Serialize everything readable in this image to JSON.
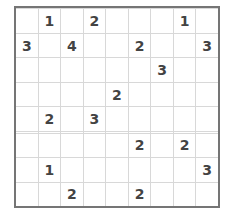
{
  "puzzle": {
    "type": "sudoku-like-number-grid",
    "columns": 9,
    "rows": 10,
    "border_color": "#757575",
    "gridline_color": "#d8d8d8",
    "digit_color": "#434343",
    "background_color": "#ffffff",
    "empty_cell_label": "",
    "grid": [
      [
        "",
        "",
        "",
        "",
        "",
        "",
        "",
        "",
        ""
      ],
      [
        "",
        "1",
        "",
        "2",
        "",
        "",
        "",
        "1",
        ""
      ],
      [
        "3",
        "",
        "4",
        "",
        "",
        "2",
        "",
        "",
        "3"
      ],
      [
        "",
        "",
        "",
        "",
        "",
        "",
        "3",
        "",
        ""
      ],
      [
        "",
        "",
        "",
        "",
        "2",
        "",
        "",
        "",
        ""
      ],
      [
        "",
        "2",
        "",
        "3",
        "",
        "",
        "",
        "",
        ""
      ],
      [
        "",
        "",
        "",
        "",
        "",
        "",
        "",
        "",
        ""
      ],
      [
        "",
        "",
        "",
        "",
        "",
        "2",
        "",
        "2",
        ""
      ],
      [
        "",
        "1",
        "",
        "",
        "",
        "",
        "",
        "",
        "3"
      ],
      [
        "",
        "",
        "2",
        "",
        "",
        "2",
        "",
        "",
        ""
      ]
    ]
  }
}
